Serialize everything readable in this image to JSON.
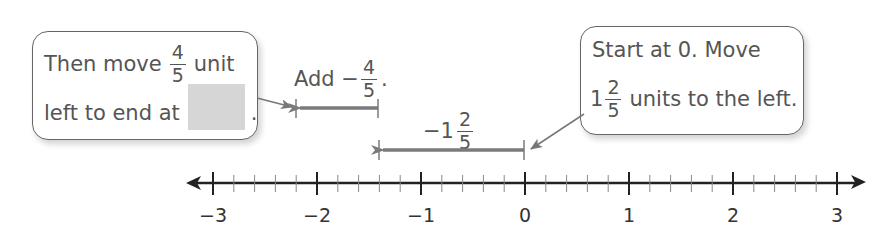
{
  "callouts": {
    "left": {
      "line1_text": "Then move",
      "line1_frac_num": "4",
      "line1_frac_den": "5",
      "line1_suffix": "unit",
      "line2_text": "left to end at",
      "line2_blank": "",
      "line2_suffix": "."
    },
    "right": {
      "line1_text": "Start at 0. Move",
      "line2_whole": "1",
      "line2_frac_num": "2",
      "line2_frac_den": "5",
      "line2_suffix": "units to the left."
    }
  },
  "labels": {
    "add": {
      "prefix": "Add −",
      "frac_num": "4",
      "frac_den": "5",
      "suffix": "."
    },
    "move": {
      "prefix": "−1",
      "frac_num": "2",
      "frac_den": "5"
    }
  },
  "number_line": {
    "min": -3,
    "max": 3,
    "major_ticks": [
      "−3",
      "−2",
      "−1",
      "0",
      "1",
      "2",
      "3"
    ],
    "minor_divisions_per_unit": 5
  },
  "colors": {
    "arrow": "#7a7a7a",
    "axis": "#222222",
    "blank_fill": "#d6d6d6"
  }
}
